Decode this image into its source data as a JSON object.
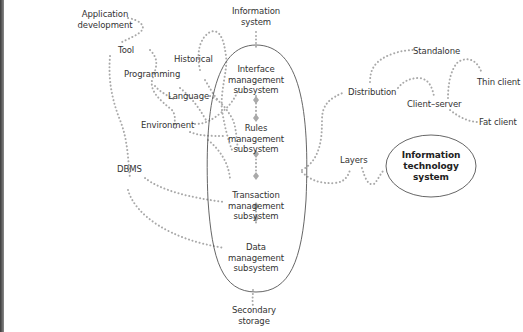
{
  "colors": {
    "dots": "#a9a9a9",
    "ellipse_stroke": "#555555",
    "text": "#333333",
    "left_edge": "#4a4a4a"
  },
  "central_ellipse": {
    "subsystems": [
      {
        "label": "Interface\nmanagement\nsubsystem"
      },
      {
        "label": "Rules\nmanagement\nsubsystem"
      },
      {
        "label": "Transaction\nmanagement\nsubsystem"
      },
      {
        "label": "Data\nmanagement\nsubsystem"
      }
    ]
  },
  "focus_node": {
    "label": "Information\ntechnology\nsystem"
  },
  "nodes": {
    "information_system": "Information\nsystem",
    "secondary_storage": "Secondary\nstorage",
    "application_development": "Application\ndevelopment",
    "tool": "Tool",
    "historical": "Historical",
    "programming": "Programming",
    "language": "Language",
    "environment": "Environment",
    "dbms": "DBMS",
    "distribution": "Distribution",
    "standalone": "Standalone",
    "client_server": "Client–server",
    "thin_client": "Thin client",
    "fat_client": "Fat client",
    "layers": "Layers"
  }
}
